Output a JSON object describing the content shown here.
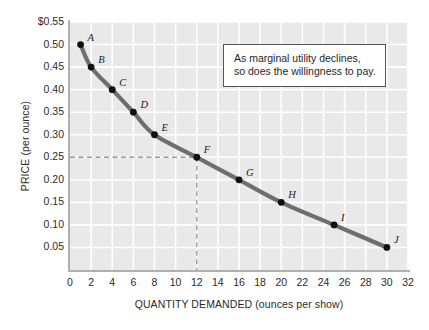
{
  "chart_data": {
    "type": "scatter",
    "title": "",
    "xlabel": "QUANTITY DEMANDED (ounces per show)",
    "ylabel": "PRICE (per ounce)",
    "xlim": [
      0,
      32
    ],
    "ylim": [
      0,
      0.55
    ],
    "grid": true,
    "legend": null,
    "xticks": [
      "0",
      "2",
      "4",
      "6",
      "8",
      "10",
      "12",
      "14",
      "16",
      "18",
      "20",
      "22",
      "24",
      "26",
      "28",
      "30",
      "32"
    ],
    "xtick_values": [
      0,
      2,
      4,
      6,
      8,
      10,
      12,
      14,
      16,
      18,
      20,
      22,
      24,
      26,
      28,
      30,
      32
    ],
    "yticks": [
      "$0.55",
      "0.50",
      "0.45",
      "0.40",
      "0.35",
      "0.30",
      "0.25",
      "0.20",
      "0.15",
      "0.10",
      "0.05"
    ],
    "ytick_values": [
      0.55,
      0.5,
      0.45,
      0.4,
      0.35,
      0.3,
      0.25,
      0.2,
      0.15,
      0.1,
      0.05
    ],
    "series": [
      {
        "name": "Demand curve",
        "points": [
          {
            "label": "A",
            "x": 1,
            "y": 0.5
          },
          {
            "label": "B",
            "x": 2,
            "y": 0.45
          },
          {
            "label": "C",
            "x": 4,
            "y": 0.4
          },
          {
            "label": "D",
            "x": 6,
            "y": 0.35
          },
          {
            "label": "E",
            "x": 8,
            "y": 0.3
          },
          {
            "label": "F",
            "x": 12,
            "y": 0.25
          },
          {
            "label": "G",
            "x": 16,
            "y": 0.2
          },
          {
            "label": "H",
            "x": 20,
            "y": 0.15
          },
          {
            "label": "I",
            "x": 25,
            "y": 0.1
          },
          {
            "label": "J",
            "x": 30,
            "y": 0.05
          }
        ]
      }
    ],
    "guides": [
      {
        "orientation": "horizontal",
        "value": 0.25,
        "style": "dashed",
        "from_axis_to": 12
      },
      {
        "orientation": "vertical",
        "value": 12,
        "style": "dashed",
        "from_axis_to": 0.25
      }
    ],
    "annotations": [
      {
        "name": "marginal-utility-note",
        "lines": [
          "As marginal utility declines,",
          "so does the willingness to pay."
        ]
      }
    ],
    "colors": {
      "plot_background": "#e9e9e9",
      "gridlines": "#ffffff",
      "curve": "#6e6e6e",
      "markers": "#111111",
      "axis": "#b0b0b0",
      "guide": "#9a9a9a",
      "text": "#2b2b2b",
      "page_background": "#ffffff"
    }
  }
}
